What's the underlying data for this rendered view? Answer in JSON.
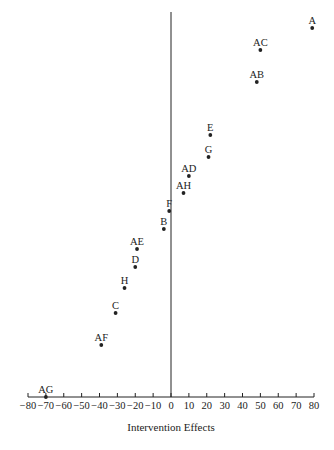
{
  "chart_data": {
    "type": "scatter",
    "title": "",
    "xlabel": "Intervention Effects",
    "ylabel": "",
    "xlim": [
      -80,
      80
    ],
    "grid": false,
    "legend": null,
    "x_ticks": [
      -80,
      -70,
      -60,
      -50,
      -40,
      -30,
      -20,
      -10,
      0,
      10,
      20,
      30,
      40,
      50,
      60,
      70,
      80
    ],
    "x_tick_labels": [
      "−80",
      "−70",
      "−60",
      "−50",
      "−40",
      "−30",
      "−20",
      "−10",
      "0",
      "10",
      "20",
      "30",
      "40",
      "50",
      "60",
      "70",
      "80"
    ],
    "reference_line": {
      "x": 0,
      "orientation": "vertical"
    },
    "points": [
      {
        "label": "A",
        "x": 79,
        "rank": 15
      },
      {
        "label": "AC",
        "x": 50,
        "rank": 14
      },
      {
        "label": "AB",
        "x": 48,
        "rank": 13
      },
      {
        "label": "E",
        "x": 22,
        "rank": 12
      },
      {
        "label": "G",
        "x": 21,
        "rank": 11
      },
      {
        "label": "AD",
        "x": 10,
        "rank": 10
      },
      {
        "label": "AH",
        "x": 7,
        "rank": 9
      },
      {
        "label": "F",
        "x": -1,
        "rank": 8
      },
      {
        "label": "B",
        "x": -4,
        "rank": 7
      },
      {
        "label": "AE",
        "x": -19,
        "rank": 6
      },
      {
        "label": "D",
        "x": -20,
        "rank": 5
      },
      {
        "label": "H",
        "x": -26,
        "rank": 4
      },
      {
        "label": "C",
        "x": -31,
        "rank": 3
      },
      {
        "label": "AF",
        "x": -39,
        "rank": 2
      },
      {
        "label": "AG",
        "x": -70,
        "rank": 1
      }
    ]
  },
  "layout": {
    "x0_px": 171,
    "px_per_unit": 1.7875,
    "axis_y_px": 397,
    "vline_top_px": 12,
    "point_y_px": {
      "A": 28,
      "AC": 50,
      "AB": 82,
      "E": 135,
      "G": 157,
      "AD": 176,
      "AH": 193,
      "F": 211,
      "B": 229,
      "AE": 249,
      "D": 267,
      "H": 288,
      "C": 313,
      "AF": 345,
      "AG": 397
    },
    "colors": {
      "ink": "#222222",
      "background": "#ffffff"
    }
  }
}
